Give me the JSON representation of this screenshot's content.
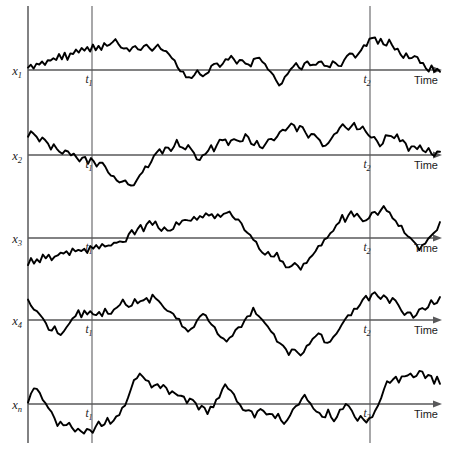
{
  "figure": {
    "title": "Ensemble of sample functions of a random process",
    "width": 454,
    "height": 449,
    "background": "#ffffff",
    "trace_color": "#000000",
    "axis_color": "#58585a",
    "vline_color": "#6d6d70"
  },
  "axis": {
    "time_label": "Time",
    "t1_label": "t",
    "t1_sub": "1",
    "t2_label": "t",
    "t2_sub": "2",
    "t1_x": 92,
    "t2_x": 370
  },
  "rows": [
    {
      "name": "x",
      "sub": "1",
      "baseline_y": 70,
      "time_label": "Time",
      "t1_label": "t",
      "t1_sub": "1",
      "t2_label": "t",
      "t2_sub": "2"
    },
    {
      "name": "x",
      "sub": "2",
      "baseline_y": 155,
      "time_label": "Time",
      "t1_label": "t",
      "t1_sub": "1",
      "t2_label": "t",
      "t2_sub": "2"
    },
    {
      "name": "x",
      "sub": "3",
      "baseline_y": 238,
      "time_label": "Time",
      "t1_label": "t",
      "t1_sub": "1",
      "t2_label": "t",
      "t2_sub": "2"
    },
    {
      "name": "x",
      "sub": "4",
      "baseline_y": 320,
      "time_label": "Time",
      "t1_label": "t",
      "t1_sub": "1",
      "t2_label": "t",
      "t2_sub": "2"
    },
    {
      "name": "x",
      "sub": "n",
      "baseline_y": 404,
      "time_label": "Time",
      "t1_label": "t",
      "t1_sub": "1",
      "t2_label": "t",
      "t2_sub": "2"
    }
  ],
  "chart_data": {
    "type": "line",
    "title": "Ensemble of sample functions of a random process",
    "xlabel": "Time",
    "ylabel": "",
    "grid": false,
    "legend": null,
    "annotations": [
      {
        "label": "t1",
        "x": 92,
        "type": "vertical-line"
      },
      {
        "label": "t2",
        "x": 370,
        "type": "vertical-line"
      }
    ],
    "x_start": 28,
    "x_end": 440,
    "amplitude_scale": 1.0,
    "series": [
      {
        "name": "x1",
        "baseline": 70,
        "values": [
          0,
          10,
          6,
          13,
          8,
          16,
          11,
          17,
          12,
          19,
          14,
          22,
          17,
          25,
          20,
          27,
          23,
          31,
          26,
          33,
          29,
          36,
          31,
          38,
          34,
          41,
          36,
          43,
          38,
          45,
          42,
          48,
          44,
          40,
          36,
          33,
          29,
          33,
          38,
          34,
          31,
          36,
          40,
          36,
          32,
          35,
          39,
          36,
          33,
          29,
          24,
          18,
          12,
          6,
          0,
          -6,
          -12,
          -8,
          -14,
          -9,
          -3,
          -8,
          -13,
          -7,
          0,
          6,
          12,
          7,
          2,
          8,
          14,
          20,
          25,
          19,
          14,
          20,
          16,
          11,
          5,
          10,
          16,
          21,
          17,
          12,
          7,
          1,
          -5,
          -11,
          -17,
          -23,
          -18,
          -12,
          -6,
          0,
          7,
          13,
          8,
          3,
          9,
          15,
          10,
          5,
          11,
          17,
          12,
          7,
          2,
          8,
          14,
          9,
          4,
          10,
          16,
          22,
          28,
          23,
          18,
          24,
          30,
          36,
          42,
          48,
          54,
          49,
          44,
          50,
          45,
          40,
          46,
          41,
          36,
          31,
          26,
          21,
          27,
          22,
          17,
          23,
          18,
          13,
          8,
          3,
          -2,
          4,
          -1,
          3,
          -2
        ]
      },
      {
        "name": "x2",
        "baseline": 155,
        "values": [
          30,
          36,
          31,
          26,
          21,
          27,
          22,
          17,
          12,
          18,
          13,
          8,
          3,
          9,
          4,
          -1,
          3,
          -2,
          -7,
          -1,
          -6,
          -11,
          -5,
          -10,
          -15,
          -9,
          -14,
          -19,
          -24,
          -30,
          -36,
          -42,
          -48,
          -43,
          -38,
          -44,
          -50,
          -45,
          -40,
          -34,
          -28,
          -22,
          -16,
          -10,
          -4,
          2,
          8,
          3,
          9,
          15,
          10,
          16,
          22,
          17,
          12,
          7,
          13,
          8,
          3,
          -3,
          -9,
          -4,
          2,
          8,
          14,
          9,
          15,
          21,
          27,
          22,
          17,
          23,
          29,
          24,
          19,
          25,
          31,
          26,
          21,
          16,
          22,
          17,
          12,
          18,
          24,
          30,
          25,
          31,
          37,
          43,
          38,
          44,
          50,
          45,
          40,
          46,
          41,
          36,
          31,
          37,
          32,
          27,
          22,
          17,
          12,
          18,
          24,
          30,
          36,
          42,
          48,
          43,
          38,
          44,
          50,
          45,
          40,
          46,
          41,
          36,
          31,
          26,
          21,
          16,
          22,
          28,
          34,
          29,
          24,
          30,
          25,
          20,
          15,
          10,
          16,
          11,
          6,
          12,
          7,
          2,
          8,
          3,
          -2,
          4,
          9
        ]
      },
      {
        "name": "x3",
        "baseline": 238,
        "values": [
          -40,
          -34,
          -38,
          -32,
          -36,
          -30,
          -34,
          -28,
          -32,
          -26,
          -30,
          -24,
          -28,
          -22,
          -26,
          -20,
          -24,
          -18,
          -22,
          -16,
          -20,
          -14,
          -18,
          -12,
          -16,
          -10,
          -14,
          -8,
          -12,
          -6,
          -10,
          -4,
          -8,
          -2,
          4,
          10,
          5,
          11,
          17,
          12,
          18,
          24,
          19,
          25,
          20,
          15,
          21,
          16,
          11,
          17,
          23,
          18,
          24,
          30,
          25,
          31,
          37,
          32,
          38,
          33,
          39,
          34,
          40,
          35,
          41,
          36,
          42,
          37,
          43,
          38,
          33,
          28,
          22,
          16,
          10,
          4,
          -2,
          -8,
          -14,
          -20,
          -26,
          -20,
          -26,
          -32,
          -27,
          -33,
          -39,
          -45,
          -51,
          -45,
          -39,
          -45,
          -51,
          -45,
          -39,
          -33,
          -27,
          -21,
          -15,
          -9,
          -3,
          3,
          9,
          15,
          21,
          27,
          33,
          28,
          34,
          40,
          35,
          41,
          36,
          31,
          25,
          31,
          37,
          43,
          38,
          44,
          50,
          45,
          40,
          34,
          28,
          22,
          16,
          10,
          4,
          -2,
          -8,
          -14,
          -20,
          -14,
          -8,
          -2,
          4,
          10,
          16,
          22
        ]
      },
      {
        "name": "x4",
        "baseline": 320,
        "values": [
          30,
          24,
          18,
          12,
          6,
          0,
          -6,
          -12,
          -18,
          -12,
          -18,
          -24,
          -18,
          -12,
          -6,
          0,
          6,
          12,
          8,
          14,
          10,
          16,
          12,
          8,
          14,
          10,
          16,
          12,
          8,
          14,
          20,
          26,
          32,
          26,
          20,
          26,
          32,
          28,
          34,
          30,
          36,
          32,
          38,
          34,
          30,
          26,
          22,
          18,
          14,
          10,
          4,
          -2,
          -8,
          -14,
          -20,
          -14,
          -8,
          -2,
          4,
          10,
          4,
          -2,
          -8,
          -14,
          -20,
          -26,
          -32,
          -38,
          -32,
          -26,
          -20,
          -14,
          -8,
          -2,
          4,
          10,
          16,
          10,
          4,
          -2,
          -8,
          -14,
          -20,
          -26,
          -32,
          -38,
          -44,
          -50,
          -56,
          -50,
          -44,
          -50,
          -56,
          -50,
          -44,
          -38,
          -32,
          -26,
          -20,
          -26,
          -32,
          -38,
          -32,
          -26,
          -20,
          -14,
          -8,
          -2,
          4,
          10,
          16,
          22,
          28,
          34,
          40,
          34,
          40,
          46,
          40,
          34,
          40,
          34,
          28,
          34,
          28,
          22,
          16,
          10,
          16,
          10,
          4,
          10,
          16,
          22,
          16,
          22,
          28,
          22,
          28,
          34
        ]
      },
      {
        "name": "xn",
        "baseline": 404,
        "values": [
          0,
          14,
          28,
          22,
          16,
          8,
          0,
          -8,
          -16,
          -24,
          -32,
          -26,
          -32,
          -38,
          -32,
          -38,
          -44,
          -38,
          -44,
          -50,
          -44,
          -38,
          -44,
          -38,
          -32,
          -38,
          -32,
          -26,
          -32,
          -26,
          -20,
          -14,
          -8,
          0,
          12,
          24,
          36,
          44,
          52,
          46,
          40,
          34,
          28,
          34,
          28,
          22,
          28,
          22,
          16,
          22,
          16,
          10,
          16,
          10,
          4,
          10,
          4,
          -2,
          -8,
          -2,
          -8,
          -14,
          -8,
          -2,
          4,
          10,
          20,
          30,
          24,
          18,
          12,
          6,
          0,
          -6,
          -12,
          -6,
          -12,
          -18,
          -12,
          -6,
          -12,
          -18,
          -12,
          -18,
          -24,
          -18,
          -24,
          -30,
          -24,
          -18,
          -12,
          -6,
          0,
          6,
          12,
          6,
          0,
          -6,
          -12,
          -18,
          -24,
          -18,
          -12,
          -18,
          -24,
          -18,
          -12,
          -6,
          0,
          -6,
          -12,
          -18,
          -24,
          -18,
          -24,
          -30,
          -24,
          -18,
          -12,
          0,
          12,
          24,
          36,
          30,
          36,
          42,
          36,
          42,
          48,
          42,
          48,
          42,
          48,
          54,
          48,
          42,
          48,
          42,
          36,
          42,
          36
        ]
      }
    ]
  }
}
